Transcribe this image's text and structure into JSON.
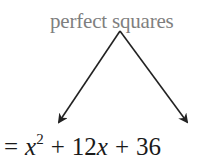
{
  "diagram": {
    "label": "perfect squares",
    "equation": {
      "equals": "=",
      "term1_var": "x",
      "term1_exp": "2",
      "plus1": "+",
      "term2_coef": "12",
      "term2_var": "x",
      "plus2": "+",
      "term3": "36"
    },
    "colors": {
      "label": "#7f7f7f",
      "arrows": "#222222",
      "equation": "#1a1a1a"
    }
  }
}
